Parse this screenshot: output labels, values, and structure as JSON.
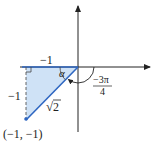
{
  "diagram": {
    "type": "unit-angle-reference-triangle",
    "colors": {
      "axis": "#222222",
      "triangle_edge": "#2f67c2",
      "triangle_fill": "#cfe2f6",
      "dashed": "#555555"
    },
    "labels": {
      "horizontal_leg": "−1",
      "vertical_leg": "−1",
      "hypotenuse_radical": "√",
      "hypotenuse_value": "2",
      "angle_alpha": "α",
      "angle_numerator": "−3π",
      "angle_denominator": "4",
      "point": "(−1, −1)"
    }
  }
}
